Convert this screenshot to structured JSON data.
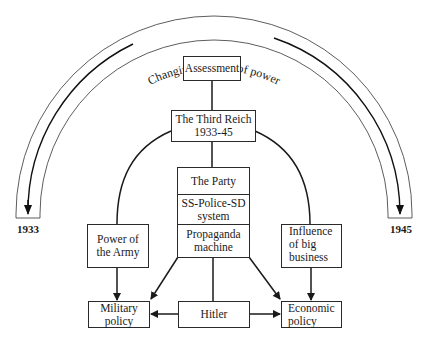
{
  "arc": {
    "label": "Changing balance of power",
    "start_year": "1933",
    "end_year": "1945"
  },
  "nodes": {
    "assessment": "Assessment",
    "third_reich": {
      "line1": "The Third Reich",
      "line2": "1933-45"
    },
    "party_stack": {
      "party": "The Party",
      "ss": {
        "line1": "SS-Police-SD",
        "line2": "system"
      },
      "propaganda": {
        "line1": "Propaganda",
        "line2": "machine"
      }
    },
    "army": {
      "line1": "Power of",
      "line2": "the Army"
    },
    "business": {
      "line1": "Influence",
      "line2": "of big",
      "line3": "business"
    },
    "military_policy": {
      "line1": "Military",
      "line2": "policy"
    },
    "hitler": "Hitler",
    "economic_policy": {
      "line1": "Economic",
      "line2": "policy"
    }
  },
  "colors": {
    "line": "#2a2a2a",
    "background": "#ffffff"
  }
}
